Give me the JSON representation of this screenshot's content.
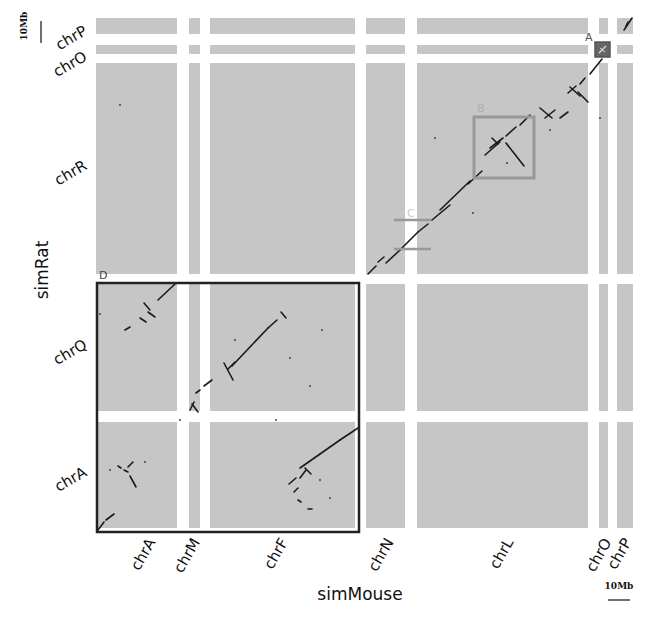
{
  "chart_data": {
    "type": "scatter",
    "subtype": "dot-plot (synteny)",
    "title": "",
    "xlabel": "simMouse",
    "ylabel": "simRat",
    "x_chromosomes": [
      {
        "name": "chrA",
        "x0": 96,
        "x1": 177
      },
      {
        "name": "chrM",
        "x0": 189,
        "x1": 200
      },
      {
        "name": "chrF",
        "x0": 210,
        "x1": 355
      },
      {
        "name": "chrN",
        "x0": 366,
        "x1": 405
      },
      {
        "name": "chrL",
        "x0": 417,
        "x1": 588
      },
      {
        "name": "chrO",
        "x0": 599,
        "x1": 608
      },
      {
        "name": "chrP",
        "x0": 617,
        "x1": 633
      }
    ],
    "y_chromosomes": [
      {
        "name": "chrP",
        "y0": 18,
        "y1": 34
      },
      {
        "name": "chrO",
        "y0": 45,
        "y1": 54
      },
      {
        "name": "chrR",
        "y0": 63,
        "y1": 274
      },
      {
        "name": "chrQ",
        "y0": 284,
        "y1": 411
      },
      {
        "name": "chrA",
        "y0": 422,
        "y1": 528
      }
    ],
    "scale_bars": {
      "y": "10Mb",
      "x": "10Mb"
    },
    "highlight_boxes": [
      {
        "label": "A",
        "x": 595,
        "y": 42,
        "w": 15,
        "h": 15,
        "color": "#555555",
        "fill": "#666666"
      },
      {
        "label": "B",
        "x": 474,
        "y": 117,
        "w": 60,
        "h": 61,
        "color": "#999999",
        "fill": "none"
      },
      {
        "label": "C",
        "x": 394,
        "y": 220,
        "w": 37,
        "h": 29,
        "color": "#999999",
        "fill": "none"
      },
      {
        "label": "D",
        "x": 97,
        "y": 283,
        "w": 262,
        "h": 249,
        "color": "#222222",
        "fill": "none"
      }
    ],
    "segments": [
      [
        632,
        18,
        624,
        30
      ],
      [
        628,
        22,
        626,
        26
      ],
      [
        607,
        44,
        598,
        56
      ],
      [
        602,
        59,
        590,
        74
      ],
      [
        585,
        78,
        580,
        84
      ],
      [
        576,
        86,
        568,
        93
      ],
      [
        570,
        87,
        580,
        96
      ],
      [
        578,
        92,
        588,
        102
      ],
      [
        555,
        110,
        545,
        118
      ],
      [
        560,
        118,
        568,
        112
      ],
      [
        540,
        108,
        552,
        118
      ],
      [
        530,
        115,
        520,
        125
      ],
      [
        516,
        127,
        506,
        136
      ],
      [
        500,
        142,
        485,
        155
      ],
      [
        490,
        148,
        503,
        138
      ],
      [
        492,
        138,
        498,
        144
      ],
      [
        506,
        143,
        524,
        166
      ],
      [
        482,
        171,
        468,
        184
      ],
      [
        470,
        181,
        440,
        210
      ],
      [
        450,
        205,
        432,
        220
      ],
      [
        428,
        224,
        418,
        232
      ],
      [
        418,
        232,
        400,
        250
      ],
      [
        400,
        250,
        386,
        263
      ],
      [
        384,
        257,
        378,
        262
      ],
      [
        376,
        266,
        368,
        274
      ],
      [
        175,
        284,
        158,
        300
      ],
      [
        150,
        310,
        144,
        303
      ],
      [
        140,
        318,
        146,
        322
      ],
      [
        130,
        327,
        125,
        330
      ],
      [
        148,
        312,
        155,
        317
      ],
      [
        281,
        312,
        286,
        318
      ],
      [
        277,
        320,
        268,
        328
      ],
      [
        268,
        328,
        232,
        366
      ],
      [
        235,
        362,
        228,
        369
      ],
      [
        224,
        363,
        233,
        380
      ],
      [
        212,
        380,
        204,
        386
      ],
      [
        200,
        390,
        196,
        393
      ],
      [
        194,
        402,
        190,
        410
      ],
      [
        192,
        404,
        198,
        412
      ],
      [
        358,
        428,
        340,
        440
      ],
      [
        340,
        440,
        320,
        454
      ],
      [
        320,
        454,
        300,
        468
      ],
      [
        306,
        470,
        300,
        478
      ],
      [
        296,
        478,
        289,
        484
      ],
      [
        298,
        488,
        294,
        492
      ],
      [
        298,
        500,
        301,
        502
      ],
      [
        308,
        509,
        312,
        509
      ],
      [
        305,
        468,
        311,
        474
      ],
      [
        133,
        462,
        128,
        467
      ],
      [
        124,
        470,
        128,
        472
      ],
      [
        130,
        476,
        136,
        487
      ],
      [
        118,
        466,
        121,
        468
      ],
      [
        114,
        514,
        106,
        520
      ],
      [
        104,
        522,
        98,
        530
      ]
    ],
    "dots": [
      [
        120,
        105
      ],
      [
        473,
        213
      ],
      [
        507,
        163
      ],
      [
        435,
        138
      ],
      [
        550,
        130
      ],
      [
        600,
        118
      ],
      [
        322,
        330
      ],
      [
        290,
        358
      ],
      [
        310,
        386
      ],
      [
        180,
        420
      ],
      [
        100,
        314
      ],
      [
        276,
        420
      ],
      [
        145,
        462
      ],
      [
        110,
        470
      ],
      [
        235,
        340
      ],
      [
        320,
        480
      ],
      [
        330,
        498
      ]
    ]
  }
}
